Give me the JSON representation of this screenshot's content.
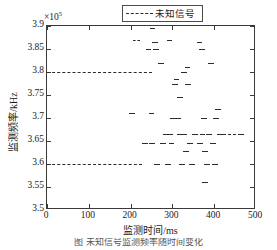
{
  "figure": {
    "exponent_prefix": "×10",
    "exponent_power": "5",
    "caption": "图   未知信号监测频率随时间变化"
  },
  "legend": {
    "position": "top-right",
    "entries": [
      {
        "label": "未知信号",
        "style": "dashed",
        "color": "#2b2b2b"
      }
    ]
  },
  "chart_data": {
    "type": "scatter",
    "title": "",
    "subtitle": "",
    "xlabel": "监测时间/ms",
    "ylabel": "监测频率/kHz",
    "y_exponent": 100000,
    "xlim": [
      0,
      500
    ],
    "ylim": [
      3.5,
      3.9
    ],
    "xticks": [
      0,
      100,
      200,
      300,
      400,
      500
    ],
    "xticklabels": [
      "0",
      "100",
      "200",
      "300",
      "400",
      "500"
    ],
    "yticks": [
      3.5,
      3.55,
      3.6,
      3.65,
      3.7,
      3.75,
      3.8,
      3.85,
      3.9
    ],
    "yticklabels": [
      "3.5",
      "3.55",
      "3.6",
      "3.65",
      "3.7",
      "3.75",
      "3.8",
      "3.85",
      "3.9"
    ],
    "grid": false,
    "marker_style": "dashed-horizontal-segment",
    "series": [
      {
        "name": "未知信号",
        "color": "#2b2b2b",
        "linestyle": "dashed",
        "segments": [
          {
            "x_start": 0,
            "x_end": 252,
            "y": 3.8
          },
          {
            "x_start": 0,
            "x_end": 228,
            "y": 3.6
          },
          {
            "x_start": 205,
            "x_end": 222,
            "y": 3.87
          },
          {
            "x_start": 196,
            "x_end": 210,
            "y": 3.71
          },
          {
            "x_start": 212,
            "x_end": 226,
            "y": 3.505
          },
          {
            "x_start": 228,
            "x_end": 242,
            "y": 3.645
          },
          {
            "x_start": 236,
            "x_end": 250,
            "y": 3.85
          },
          {
            "x_start": 240,
            "x_end": 254,
            "y": 3.505
          },
          {
            "x_start": 243,
            "x_end": 257,
            "y": 3.71
          },
          {
            "x_start": 244,
            "x_end": 258,
            "y": 3.645
          },
          {
            "x_start": 246,
            "x_end": 258,
            "y": 3.895
          },
          {
            "x_start": 252,
            "x_end": 266,
            "y": 3.865
          },
          {
            "x_start": 254,
            "x_end": 268,
            "y": 3.85
          },
          {
            "x_start": 256,
            "x_end": 270,
            "y": 3.6
          },
          {
            "x_start": 262,
            "x_end": 276,
            "y": 3.505
          },
          {
            "x_start": 266,
            "x_end": 280,
            "y": 3.82
          },
          {
            "x_start": 270,
            "x_end": 284,
            "y": 3.645
          },
          {
            "x_start": 277,
            "x_end": 291,
            "y": 3.665
          },
          {
            "x_start": 283,
            "x_end": 297,
            "y": 3.6
          },
          {
            "x_start": 286,
            "x_end": 300,
            "y": 3.87
          },
          {
            "x_start": 288,
            "x_end": 302,
            "y": 3.665
          },
          {
            "x_start": 291,
            "x_end": 305,
            "y": 3.645
          },
          {
            "x_start": 294,
            "x_end": 308,
            "y": 3.7
          },
          {
            "x_start": 300,
            "x_end": 314,
            "y": 3.775
          },
          {
            "x_start": 303,
            "x_end": 317,
            "y": 3.785
          },
          {
            "x_start": 306,
            "x_end": 320,
            "y": 3.7
          },
          {
            "x_start": 310,
            "x_end": 324,
            "y": 3.665
          },
          {
            "x_start": 312,
            "x_end": 326,
            "y": 3.745
          },
          {
            "x_start": 316,
            "x_end": 330,
            "y": 3.6
          },
          {
            "x_start": 320,
            "x_end": 334,
            "y": 3.8
          },
          {
            "x_start": 322,
            "x_end": 336,
            "y": 3.665
          },
          {
            "x_start": 326,
            "x_end": 340,
            "y": 3.628
          },
          {
            "x_start": 329,
            "x_end": 343,
            "y": 3.81
          },
          {
            "x_start": 331,
            "x_end": 345,
            "y": 3.775
          },
          {
            "x_start": 336,
            "x_end": 350,
            "y": 3.645
          },
          {
            "x_start": 340,
            "x_end": 354,
            "y": 3.6
          },
          {
            "x_start": 347,
            "x_end": 361,
            "y": 3.665
          },
          {
            "x_start": 356,
            "x_end": 370,
            "y": 3.505
          },
          {
            "x_start": 358,
            "x_end": 372,
            "y": 3.865
          },
          {
            "x_start": 360,
            "x_end": 374,
            "y": 3.645
          },
          {
            "x_start": 363,
            "x_end": 377,
            "y": 3.85
          },
          {
            "x_start": 365,
            "x_end": 379,
            "y": 3.665
          },
          {
            "x_start": 368,
            "x_end": 382,
            "y": 3.7
          },
          {
            "x_start": 370,
            "x_end": 384,
            "y": 3.628
          },
          {
            "x_start": 372,
            "x_end": 386,
            "y": 3.56
          },
          {
            "x_start": 376,
            "x_end": 390,
            "y": 3.6
          },
          {
            "x_start": 380,
            "x_end": 394,
            "y": 3.665
          },
          {
            "x_start": 384,
            "x_end": 398,
            "y": 3.505
          },
          {
            "x_start": 386,
            "x_end": 400,
            "y": 3.82
          },
          {
            "x_start": 390,
            "x_end": 404,
            "y": 3.645
          },
          {
            "x_start": 394,
            "x_end": 408,
            "y": 3.6
          },
          {
            "x_start": 398,
            "x_end": 412,
            "y": 3.7
          },
          {
            "x_start": 402,
            "x_end": 416,
            "y": 3.72
          },
          {
            "x_start": 406,
            "x_end": 420,
            "y": 3.665
          },
          {
            "x_start": 414,
            "x_end": 428,
            "y": 3.665
          },
          {
            "x_start": 426,
            "x_end": 440,
            "y": 3.505
          },
          {
            "x_start": 432,
            "x_end": 452,
            "y": 3.665
          },
          {
            "x_start": 456,
            "x_end": 472,
            "y": 3.665
          },
          {
            "x_start": 462,
            "x_end": 476,
            "y": 3.505
          }
        ]
      }
    ]
  }
}
